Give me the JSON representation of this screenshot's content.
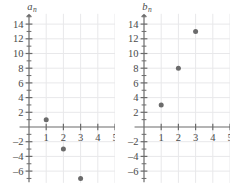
{
  "figure": {
    "panel_count": 2
  },
  "chart_data": [
    {
      "type": "scatter",
      "title": "",
      "xlabel": "n",
      "ylabel": "a_n",
      "ylabel_base": "a",
      "ylabel_sub": "n",
      "x": [
        1,
        2,
        3
      ],
      "values": [
        1,
        -3,
        -7
      ],
      "points": [
        {
          "x": 1,
          "y": 1
        },
        {
          "x": 2,
          "y": -3
        },
        {
          "x": 3,
          "y": -7
        }
      ],
      "xlim": [
        -0.6,
        5.9
      ],
      "ylim": [
        -7.6,
        15.4
      ],
      "xticks": [
        1,
        2,
        3,
        4,
        5
      ],
      "xtick_labels": [
        "1",
        "2",
        "3",
        "4",
        "5"
      ],
      "yticks": [
        -6,
        -4,
        -2,
        2,
        4,
        6,
        8,
        10,
        12,
        14
      ],
      "ytick_labels": [
        "-6",
        "-4",
        "-2",
        "2",
        "4",
        "6",
        "8",
        "10",
        "12",
        "14"
      ],
      "grid": true,
      "grid_x_step": 1,
      "grid_y_step": 2,
      "legend": "none",
      "marker_color": "#6b6b6b",
      "axis_color": "#6b6b6b",
      "grid_color": "#e8e8ea"
    },
    {
      "type": "scatter",
      "title": "",
      "xlabel": "n",
      "ylabel": "b_n",
      "ylabel_base": "b",
      "ylabel_sub": "n",
      "x": [
        1,
        2,
        3
      ],
      "values": [
        3,
        8,
        13
      ],
      "points": [
        {
          "x": 1,
          "y": 3
        },
        {
          "x": 2,
          "y": 8
        },
        {
          "x": 3,
          "y": 13
        }
      ],
      "xlim": [
        -0.6,
        5.9
      ],
      "ylim": [
        -7.6,
        15.4
      ],
      "xticks": [
        1,
        2,
        3,
        4,
        5
      ],
      "xtick_labels": [
        "1",
        "2",
        "3",
        "4",
        "5"
      ],
      "yticks": [
        -6,
        -4,
        -2,
        2,
        4,
        6,
        8,
        10,
        12,
        14
      ],
      "ytick_labels": [
        "-6",
        "-4",
        "-2",
        "2",
        "4",
        "6",
        "8",
        "10",
        "12",
        "14"
      ],
      "grid": true,
      "grid_x_step": 1,
      "grid_y_step": 2,
      "legend": "none",
      "marker_color": "#6b6b6b",
      "axis_color": "#6b6b6b",
      "grid_color": "#e8e8ea"
    }
  ]
}
